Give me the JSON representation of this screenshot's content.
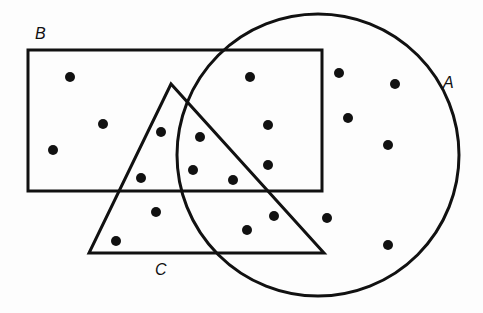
{
  "diagram": {
    "type": "venn",
    "colors": {
      "stroke": "#111111",
      "dot": "#111111",
      "background": "#fdfdfd"
    },
    "sets": [
      {
        "id": "A",
        "label": "A",
        "shape": "circle",
        "cx": 318,
        "cy": 155,
        "r": 141,
        "label_pos": [
          443,
          74
        ]
      },
      {
        "id": "B",
        "label": "B",
        "shape": "rectangle",
        "x": 28,
        "y": 50,
        "width": 294,
        "height": 141,
        "label_pos": [
          35,
          25
        ]
      },
      {
        "id": "C",
        "label": "C",
        "shape": "triangle",
        "points": [
          [
            171,
            84
          ],
          [
            89,
            253
          ],
          [
            324,
            253
          ]
        ],
        "label_pos": [
          155,
          261
        ]
      }
    ],
    "dots": [
      [
        70,
        77
      ],
      [
        103,
        124
      ],
      [
        53,
        150
      ],
      [
        161,
        132
      ],
      [
        200,
        137
      ],
      [
        250,
        77
      ],
      [
        268,
        125
      ],
      [
        193,
        170
      ],
      [
        233,
        180
      ],
      [
        268,
        165
      ],
      [
        141,
        178
      ],
      [
        156,
        212
      ],
      [
        116,
        241
      ],
      [
        247,
        230
      ],
      [
        274,
        216
      ],
      [
        327,
        218
      ],
      [
        339,
        73
      ],
      [
        395,
        84
      ],
      [
        348,
        118
      ],
      [
        388,
        145
      ],
      [
        388,
        245
      ]
    ]
  }
}
